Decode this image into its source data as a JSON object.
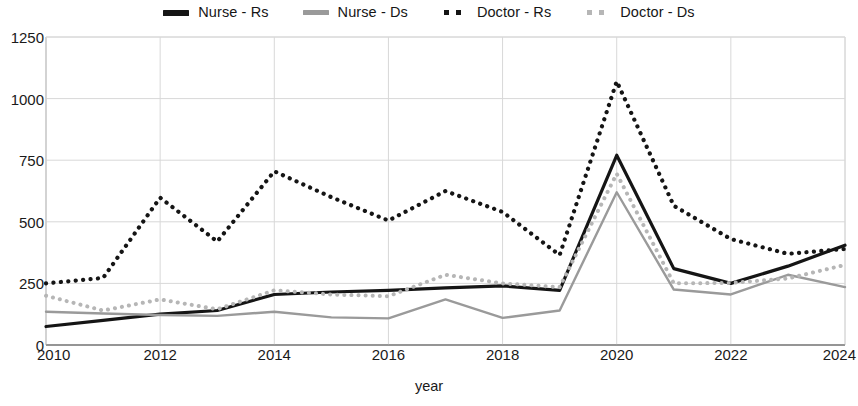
{
  "chart_data": {
    "type": "line",
    "title": "",
    "xlabel": "year",
    "ylabel": "",
    "x": [
      2010,
      2011,
      2012,
      2013,
      2014,
      2015,
      2016,
      2017,
      2018,
      2019,
      2020,
      2021,
      2022,
      2023,
      2024
    ],
    "xlim": [
      2010,
      2024
    ],
    "ylim": [
      0,
      1250
    ],
    "yticks": [
      0,
      250,
      500,
      750,
      1000,
      1250
    ],
    "xticks": [
      2010,
      2012,
      2014,
      2016,
      2018,
      2020,
      2022,
      2024
    ],
    "grid": true,
    "legend_position": "top-center",
    "series": [
      {
        "name": "Nurse - Rs",
        "style": "solid",
        "color": "#151515",
        "width": 3.2,
        "values": [
          75,
          100,
          125,
          140,
          205,
          215,
          222,
          232,
          240,
          222,
          770,
          310,
          250,
          320,
          405
        ]
      },
      {
        "name": "Nurse - Ds",
        "style": "solid",
        "color": "#9a9a9a",
        "width": 2.4,
        "values": [
          135,
          128,
          122,
          118,
          135,
          112,
          108,
          185,
          110,
          140,
          620,
          225,
          205,
          285,
          235
        ]
      },
      {
        "name": "Doctor - Rs",
        "style": "dotted",
        "color": "#151515",
        "width": 4.2,
        "values": [
          250,
          272,
          598,
          420,
          705,
          600,
          505,
          625,
          540,
          365,
          1070,
          565,
          430,
          370,
          390
        ]
      },
      {
        "name": "Doctor - Ds",
        "style": "dotted",
        "color": "#b6b6b6",
        "width": 4.0,
        "values": [
          200,
          140,
          185,
          145,
          222,
          205,
          198,
          285,
          250,
          235,
          695,
          250,
          252,
          270,
          325
        ]
      }
    ]
  },
  "legend": {
    "items": [
      {
        "label": "Nurse - Rs",
        "key": "solid-bold-dark"
      },
      {
        "label": "Nurse - Ds",
        "key": "solid-gray"
      },
      {
        "label": "Doctor - Rs",
        "key": "dotted-dark"
      },
      {
        "label": "Doctor - Ds",
        "key": "dotted-light"
      }
    ]
  },
  "axes": {
    "y_tick_labels": [
      "0",
      "250",
      "500",
      "750",
      "1000",
      "1250"
    ],
    "x_tick_labels": [
      "2010",
      "2012",
      "2014",
      "2016",
      "2018",
      "2020",
      "2022",
      "2024"
    ],
    "x_title": "year"
  }
}
